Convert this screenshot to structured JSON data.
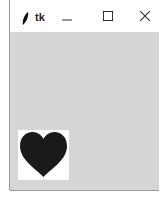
{
  "window": {
    "title": "tk",
    "icon": "feather-icon",
    "controls": {
      "minimize": "—",
      "maximize": "☐",
      "close": "✕"
    }
  },
  "canvas": {
    "image": "heart-icon",
    "heart_color": "#1a1a1a",
    "image_background": "#ffffff",
    "client_background": "#d6d6d6"
  }
}
